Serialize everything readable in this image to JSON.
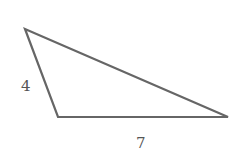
{
  "diagram": {
    "type": "triangle",
    "vertices": {
      "top_left": [
        25,
        29
      ],
      "bottom_left": [
        58,
        117
      ],
      "bottom_right": [
        228,
        117
      ]
    },
    "stroke_color": "#666666",
    "labels": {
      "left_side": "4",
      "bottom_side": "7"
    }
  }
}
